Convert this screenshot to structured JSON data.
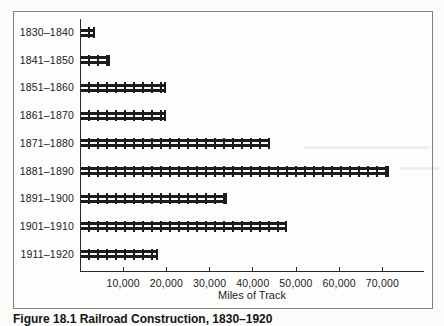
{
  "figure": {
    "caption": "Figure 18.1 Railroad Construction, 1830–1920"
  },
  "chart_data": {
    "type": "bar",
    "orientation": "horizontal",
    "title": "",
    "xlabel": "Miles of Track",
    "ylabel": "",
    "categories": [
      "1830–1840",
      "1841–1850",
      "1851–1860",
      "1861–1870",
      "1871–1880",
      "1881–1890",
      "1891–1900",
      "1901–1910",
      "1911–1920"
    ],
    "values": [
      3500,
      7000,
      20000,
      20000,
      44000,
      71500,
      34000,
      48000,
      18000
    ],
    "xlim": [
      0,
      80000
    ],
    "xticks": [
      10000,
      20000,
      30000,
      40000,
      50000,
      60000,
      70000
    ],
    "xtick_labels": [
      "10,000",
      "20,000",
      "30,000",
      "40,000",
      "50,000",
      "60,000",
      "70,000"
    ],
    "grid": "off",
    "legend": "none",
    "bar_style": "railroad-track",
    "bar_color": "#1c1c1c"
  }
}
